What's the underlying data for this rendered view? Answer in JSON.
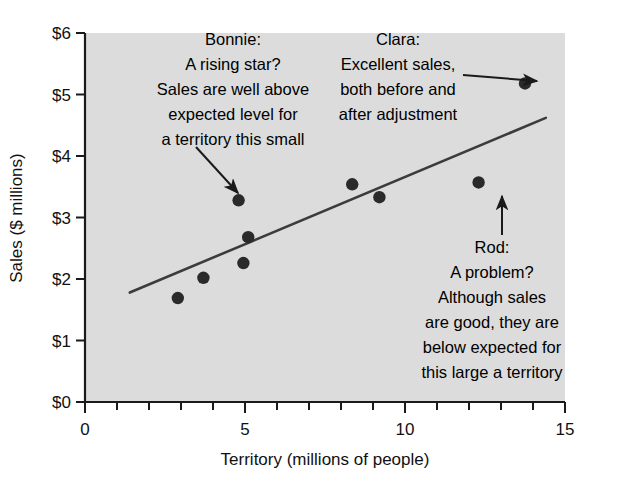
{
  "chart_data": {
    "type": "scatter",
    "title": "",
    "xlabel": "Territory (millions of people)",
    "ylabel": "Sales ($ millions)",
    "xlim": [
      0,
      15
    ],
    "ylim": [
      0,
      6
    ],
    "xticks": [
      0,
      5,
      10,
      15
    ],
    "xtick_labels": [
      "0",
      "5",
      "10",
      "15"
    ],
    "x_minor_tick_step": 1,
    "yticks": [
      0,
      1,
      2,
      3,
      4,
      5,
      6
    ],
    "ytick_labels": [
      "$0",
      "$1",
      "$2",
      "$3",
      "$4",
      "$5",
      "$6"
    ],
    "grid": false,
    "legend": false,
    "plot_background": "#dcdcdc",
    "point_color": "#2a2a2a",
    "line_color": "#3c3c3c",
    "points": [
      {
        "x": 2.9,
        "y": 1.69,
        "label": ""
      },
      {
        "x": 3.7,
        "y": 2.02,
        "label": ""
      },
      {
        "x": 4.8,
        "y": 3.28,
        "label": "Bonnie"
      },
      {
        "x": 5.1,
        "y": 2.68,
        "label": ""
      },
      {
        "x": 4.95,
        "y": 2.26,
        "label": ""
      },
      {
        "x": 8.35,
        "y": 3.54,
        "label": ""
      },
      {
        "x": 9.2,
        "y": 3.33,
        "label": ""
      },
      {
        "x": 12.3,
        "y": 3.57,
        "label": "Rod"
      },
      {
        "x": 13.75,
        "y": 5.18,
        "label": "Clara"
      }
    ],
    "trend_line": {
      "x_start": 1.4,
      "y_start": 1.78,
      "x_end": 14.4,
      "y_end": 4.62,
      "description": "regression line"
    },
    "annotations": [
      {
        "id": "bonnie",
        "lines": [
          "Bonnie:",
          "A rising star?",
          "Sales are well above",
          "expected level for",
          "a territory this small"
        ],
        "points_to": {
          "x": 4.8,
          "y": 3.28
        }
      },
      {
        "id": "clara",
        "lines": [
          "Clara:",
          "Excellent sales,",
          "both before and",
          "after adjustment"
        ],
        "points_to": {
          "x": 13.75,
          "y": 5.18
        }
      },
      {
        "id": "rod",
        "lines": [
          "Rod:",
          "A problem?",
          "Although sales",
          "are good, they are",
          "below expected for",
          "this large a territory"
        ],
        "points_to": {
          "x": 12.3,
          "y": 3.57
        }
      }
    ]
  }
}
